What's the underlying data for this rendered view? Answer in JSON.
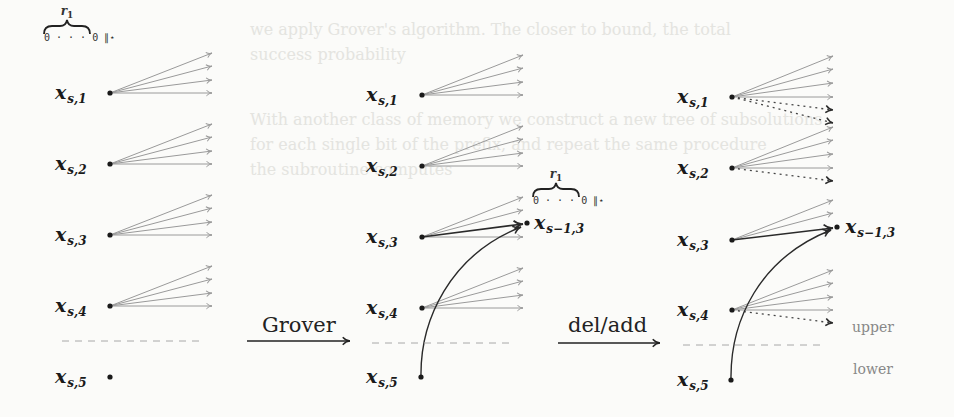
{
  "diagram": {
    "columns": [
      {
        "id": "initial",
        "rows": [
          {
            "var": "x",
            "sub": "s,1"
          },
          {
            "var": "x",
            "sub": "s,2"
          },
          {
            "var": "x",
            "sub": "s,3"
          },
          {
            "var": "x",
            "sub": "s,4"
          },
          {
            "var": "x",
            "sub": "s,5"
          }
        ],
        "brace": {
          "label": "r",
          "label_sub": "1",
          "under": "0 · · · 0 ∥⋆"
        }
      },
      {
        "id": "after-grover",
        "rows": [
          {
            "var": "x",
            "sub": "s,1"
          },
          {
            "var": "x",
            "sub": "s,2"
          },
          {
            "var": "x",
            "sub": "s,3"
          },
          {
            "var": "x",
            "sub": "s,4"
          },
          {
            "var": "x",
            "sub": "s,5"
          }
        ],
        "target": {
          "var": "x",
          "sub": "s−1,3"
        },
        "brace": {
          "label": "r",
          "label_sub": "1",
          "under": "0 · · · 0 ∥⋆"
        }
      },
      {
        "id": "after-del-add",
        "rows": [
          {
            "var": "x",
            "sub": "s,1"
          },
          {
            "var": "x",
            "sub": "s,2"
          },
          {
            "var": "x",
            "sub": "s,3"
          },
          {
            "var": "x",
            "sub": "s,4"
          },
          {
            "var": "x",
            "sub": "s,5"
          }
        ],
        "target": {
          "var": "x",
          "sub": "s−1,3"
        }
      }
    ],
    "transitions": [
      {
        "label": "Grover"
      },
      {
        "label": "del/add"
      }
    ],
    "regions": {
      "upper": "upper",
      "lower": "lower"
    },
    "colors": {
      "fan_arrow": "#9a9a9a",
      "highlight_arrow": "#2a2a2a",
      "dashed_divider": "#a8a8a8",
      "region_label": "#888888",
      "background": "#fbfbf9"
    }
  },
  "background_text": {
    "line1": "we apply Grover's algorithm. The closer to bound, the total",
    "line2": "success probability",
    "line3": "With another class of memory we construct a new tree of subsolutions",
    "line4": "for each single bit of the prefix, and repeat the same procedure",
    "line5": "the subroutine computes"
  }
}
